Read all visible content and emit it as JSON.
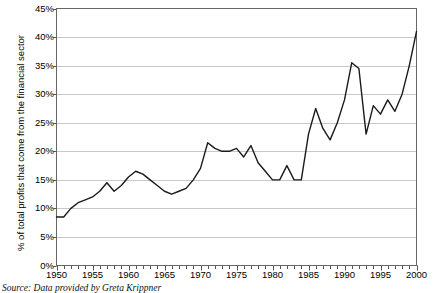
{
  "chart_data": {
    "type": "line",
    "title": "",
    "subtitle": "",
    "xlabel": "",
    "ylabel": "% of total profits that come from the financial sector",
    "xlim": [
      1950,
      2000
    ],
    "ylim": [
      0,
      45
    ],
    "grid": "horizontal",
    "legend": "none",
    "y_tick_labels": [
      "0%",
      "5%",
      "10%",
      "15%",
      "20%",
      "25%",
      "30%",
      "35%",
      "40%",
      "45%"
    ],
    "y_ticks": [
      0,
      5,
      10,
      15,
      20,
      25,
      30,
      35,
      40,
      45
    ],
    "x_tick_labels": [
      "1950",
      "1955",
      "1960",
      "1965",
      "1970",
      "1975",
      "1980",
      "1985",
      "1990",
      "1995",
      "2000"
    ],
    "x_ticks": [
      1950,
      1955,
      1960,
      1965,
      1970,
      1975,
      1980,
      1985,
      1990,
      1995,
      2000
    ],
    "x_minor_tick_interval": 1,
    "line_color": "#1a1a1a",
    "grid_color": "#c8c8c8",
    "axis_color": "#555555",
    "background_color": "#ffffff",
    "x": [
      1950,
      1951,
      1952,
      1953,
      1954,
      1955,
      1956,
      1957,
      1958,
      1959,
      1960,
      1961,
      1962,
      1963,
      1964,
      1965,
      1966,
      1967,
      1968,
      1969,
      1970,
      1971,
      1972,
      1973,
      1974,
      1975,
      1976,
      1977,
      1978,
      1979,
      1980,
      1981,
      1982,
      1983,
      1984,
      1985,
      1986,
      1987,
      1988,
      1989,
      1990,
      1991,
      1992,
      1993,
      1994,
      1995,
      1996,
      1997,
      1998,
      1999,
      2000
    ],
    "values": [
      8.5,
      8.5,
      10.0,
      11.0,
      11.5,
      12.0,
      13.0,
      14.5,
      13.0,
      14.0,
      15.5,
      16.5,
      16.0,
      15.0,
      14.0,
      13.0,
      12.5,
      13.0,
      13.5,
      15.0,
      17.0,
      21.5,
      20.5,
      20.0,
      20.0,
      20.5,
      19.0,
      21.0,
      18.0,
      16.5,
      15.0,
      15.0,
      17.5,
      15.0,
      15.0,
      23.0,
      27.5,
      24.0,
      22.0,
      25.0,
      29.0,
      35.5,
      34.5,
      23.0,
      28.0,
      26.5,
      29.0,
      27.0,
      30.0,
      35.0,
      41.0
    ]
  },
  "source": {
    "label": "Source:",
    "text": " Data provided by Greta Krippner"
  }
}
